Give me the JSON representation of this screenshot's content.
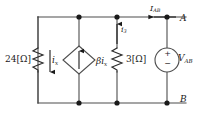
{
  "diagram": {
    "type": "electrical-schematic",
    "stroke_color": "#4d4d4d",
    "text_color": "#1a1a1a"
  },
  "labels": {
    "resistor_24": "24[Ω]",
    "resistor_3": "3[Ω]",
    "current_ix": "i",
    "current_ix_sub": "x",
    "current_i3": "i",
    "current_i3_sub": "3",
    "current_iab": "I",
    "current_iab_sub": "AB",
    "dependent_source": "βi",
    "dependent_source_sub": "x",
    "voltage_vab": "V",
    "voltage_vab_sub": "AB",
    "node_a": "A",
    "node_b": "B",
    "source_plus": "+",
    "source_minus": "−"
  },
  "components": [
    {
      "name": "resistor-24-ohm",
      "label": "24[Ω]",
      "kind": "resistor"
    },
    {
      "name": "dependent-current-source",
      "label": "βix",
      "kind": "dependent-current-source"
    },
    {
      "name": "resistor-3-ohm",
      "label": "3[Ω]",
      "kind": "resistor"
    },
    {
      "name": "voltage-source-vab",
      "label": "VAB",
      "kind": "independent-voltage-source"
    }
  ],
  "nodes": [
    {
      "name": "node-a",
      "label": "A"
    },
    {
      "name": "node-b",
      "label": "B"
    }
  ],
  "currents": [
    {
      "name": "current-ix",
      "label": "ix",
      "direction": "down"
    },
    {
      "name": "current-i3",
      "label": "i3",
      "direction": "up"
    },
    {
      "name": "current-iab",
      "label": "IAB",
      "direction": "left"
    }
  ]
}
